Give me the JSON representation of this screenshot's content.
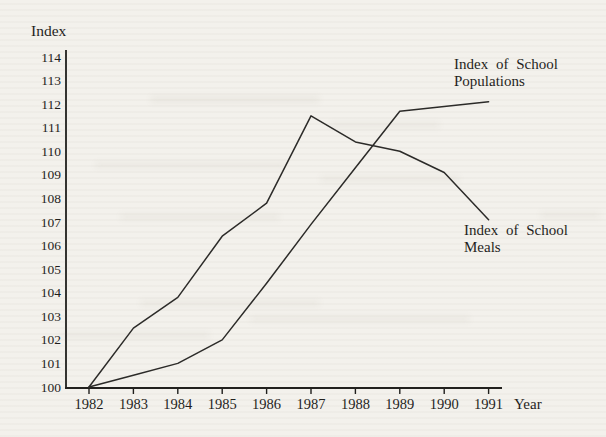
{
  "page": {
    "background": "#f3f1ec",
    "ink": "#1f1e1c"
  },
  "chart_data": {
    "type": "line",
    "xlabel": "Year",
    "ylabel": "Index",
    "x": [
      1982,
      1983,
      1984,
      1985,
      1986,
      1987,
      1988,
      1989,
      1990,
      1991
    ],
    "series": [
      {
        "name": "Index of School Populations",
        "values": [
          100,
          100.5,
          101,
          102,
          104.4,
          106.9,
          109.3,
          111.7,
          111.9,
          112.1
        ]
      },
      {
        "name": "Index of School Meals",
        "values": [
          100,
          102.5,
          103.8,
          106.4,
          107.8,
          111.5,
          110.4,
          110,
          109.1,
          107.1
        ]
      }
    ],
    "ylim": [
      100,
      114
    ],
    "ytick_step": 1,
    "xlim": [
      1982,
      1991
    ],
    "grid": false,
    "legend_position": "inline-annotations",
    "line_color": "#2b2a28"
  },
  "annotations": {
    "populations": {
      "line1": "Index of School",
      "line2": "Populations"
    },
    "meals": {
      "line1": "Index of School",
      "line2": "Meals"
    }
  }
}
